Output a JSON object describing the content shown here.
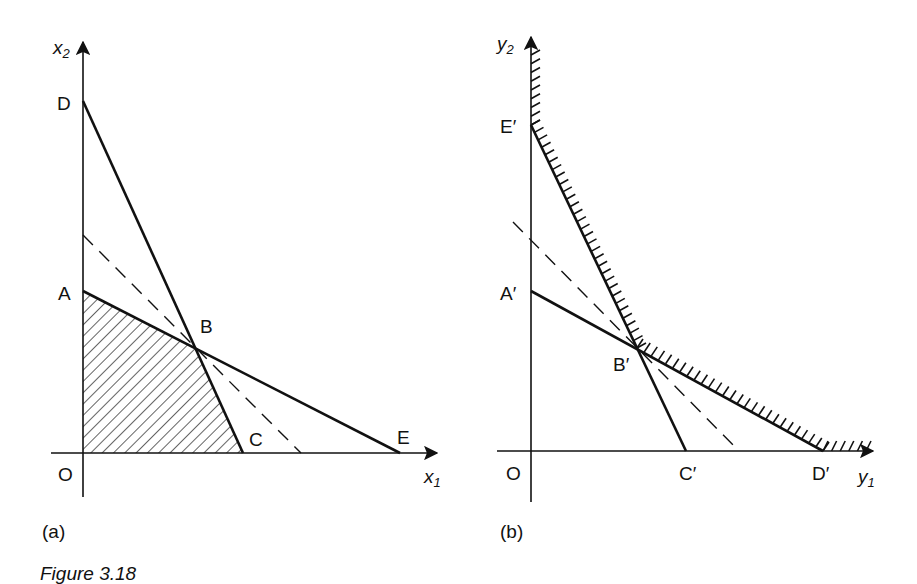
{
  "figure": {
    "caption": "Figure 3.18",
    "panels": [
      {
        "id": "a",
        "tag": "(a)",
        "axes": {
          "x_label": "x",
          "x_sub": "1",
          "y_label": "x",
          "y_sub": "2",
          "origin_label": "O"
        },
        "points": {
          "A": "A",
          "B": "B",
          "C": "C",
          "D": "D",
          "E": "E"
        },
        "lines": [
          {
            "name": "DC",
            "from": "D",
            "to": "C",
            "style": "solid"
          },
          {
            "name": "AE",
            "from": "A",
            "to": "E",
            "style": "solid"
          },
          {
            "name": "objective",
            "style": "dashed",
            "through": "B"
          }
        ],
        "shaded_region": "OABC (feasible region, hatched)"
      },
      {
        "id": "b",
        "tag": "(b)",
        "axes": {
          "x_label": "y",
          "x_sub": "1",
          "y_label": "y",
          "y_sub": "2",
          "origin_label": "O"
        },
        "points": {
          "A": "A′",
          "B": "B′",
          "C": "C′",
          "D": "D′",
          "E": "E′"
        },
        "lines": [
          {
            "name": "E'C'",
            "from": "E′",
            "to": "C′",
            "style": "solid"
          },
          {
            "name": "A'D'",
            "from": "A′",
            "to": "D′",
            "style": "solid"
          },
          {
            "name": "objective",
            "style": "dashed",
            "through": "B′"
          }
        ],
        "shaded_region": "boundary E'B'D' hatched on outer side (unbounded feasible region)"
      }
    ]
  }
}
